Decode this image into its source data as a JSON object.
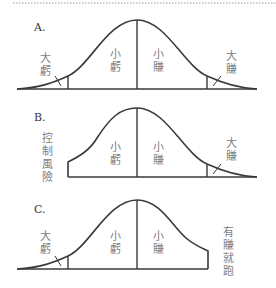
{
  "figure": {
    "panels": [
      {
        "label": "A.",
        "left_region": "大\n虧",
        "left_region_chars": [
          "大",
          "虧"
        ],
        "mid_left": [
          "小",
          "虧"
        ],
        "mid_right": [
          "小",
          "賺"
        ],
        "right_region_chars": [
          "大",
          "賺"
        ],
        "cut_left": false,
        "cut_right": false
      },
      {
        "label": "B.",
        "side_note_chars": [
          "控",
          "制",
          "風",
          "險"
        ],
        "mid_left": [
          "小",
          "虧"
        ],
        "mid_right": [
          "小",
          "賺"
        ],
        "right_region_chars": [
          "大",
          "賺"
        ],
        "cut_left": true,
        "cut_right": false
      },
      {
        "label": "C.",
        "left_region_chars": [
          "大",
          "虧"
        ],
        "mid_left": [
          "小",
          "虧"
        ],
        "mid_right": [
          "小",
          "賺"
        ],
        "side_note_chars": [
          "有",
          "賺",
          "就",
          "跑"
        ],
        "cut_left": false,
        "cut_right": true
      }
    ],
    "colors": {
      "stroke": "#3a3a3a",
      "text": "#808080",
      "label": "#333333",
      "divider": "#9a9a9a"
    }
  }
}
